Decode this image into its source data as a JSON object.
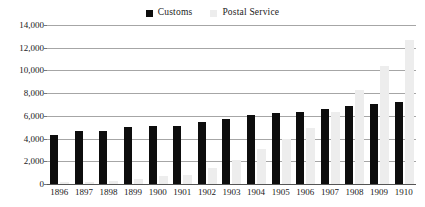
{
  "chart_data": {
    "type": "bar",
    "title": "",
    "subtitle": "",
    "xlabel": "",
    "ylabel": "",
    "categories": [
      "1896",
      "1897",
      "1898",
      "1899",
      "1900",
      "1901",
      "1902",
      "1903",
      "1904",
      "1905",
      "1906",
      "1907",
      "1908",
      "1909",
      "1910"
    ],
    "series": [
      {
        "name": "Customs",
        "color": "#0d0d0d",
        "values": [
          4350,
          4650,
          4700,
          5000,
          5100,
          5100,
          5450,
          5700,
          6050,
          6250,
          6300,
          6600,
          6900,
          7050,
          7250
        ]
      },
      {
        "name": "Postal Service",
        "color": "#ededed",
        "values": [
          150,
          200,
          300,
          400,
          700,
          800,
          1400,
          2100,
          3100,
          4000,
          4900,
          6300,
          8300,
          10400,
          12700
        ]
      }
    ],
    "ylim": [
      0,
      14000
    ],
    "ytick_values": [
      0,
      2000,
      4000,
      6000,
      8000,
      10000,
      12000,
      14000
    ],
    "ytick_labels": [
      "0",
      "2,000",
      "4,000",
      "6,000",
      "8,000",
      "10,000",
      "12,000",
      "14,000"
    ],
    "grid": true,
    "grid_axis": "y",
    "legend_position": "top-center",
    "legend": [
      {
        "label": "Customs",
        "swatch": "#0d0d0d",
        "icon": "legend-square-icon"
      },
      {
        "label": "Postal Service",
        "swatch": "#ededed",
        "icon": "legend-square-icon"
      }
    ]
  }
}
